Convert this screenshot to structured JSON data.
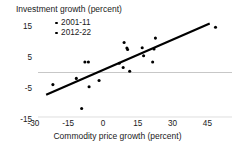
{
  "chart_data": {
    "type": "scatter",
    "title": "Investment growth (percent)",
    "xlabel": "Commodity price growth (percent)",
    "ylabel": "Investment growth (percent)",
    "xlim": [
      -30,
      50
    ],
    "ylim": [
      -15,
      18
    ],
    "xticks": [
      -30,
      -15,
      0,
      15,
      30,
      45
    ],
    "xticklabels": [
      "-30",
      "-15",
      "0",
      "15",
      "30",
      "45"
    ],
    "yticks": [
      15,
      5,
      -5,
      -15
    ],
    "yticklabels": [
      "15",
      "5",
      "-5",
      "-15"
    ],
    "grid": "zero-line-only",
    "legend_position": "top-left",
    "marker_color": "#000000",
    "trendline_color": "#000000",
    "zero_line_color": "#b9b9b9",
    "legend": [
      {
        "name": "2001-11",
        "marker": "dot"
      },
      {
        "name": "2012-22",
        "marker": "dot"
      }
    ],
    "series": [
      {
        "name": "2001-11",
        "points": [
          [
            -21.6,
            -3.9
          ],
          [
            -11.5,
            -1.9
          ],
          [
            -9.2,
            -11.6
          ],
          [
            -7.8,
            3.4
          ],
          [
            -6.3,
            3.4
          ],
          [
            -6.0,
            -4.6
          ],
          [
            -1.7,
            -2.6
          ],
          [
            7.0,
            3.0
          ],
          [
            8.7,
            1.6
          ],
          [
            9.1,
            9.7
          ],
          [
            10.3,
            7.9
          ],
          [
            10.6,
            7.4
          ],
          [
            11.5,
            0.4
          ],
          [
            16.9,
            8.0
          ],
          [
            17.5,
            5.4
          ],
          [
            21.4,
            3.4
          ],
          [
            22.0,
            7.6
          ],
          [
            22.6,
            11.1
          ],
          [
            48.5,
            14.6
          ]
        ]
      }
    ],
    "trendline": {
      "x": [
        -24.5,
        46.0
      ],
      "y": [
        -7.2,
        15.8
      ]
    }
  }
}
